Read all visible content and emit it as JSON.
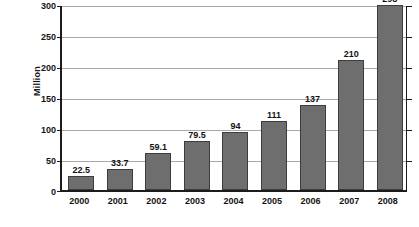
{
  "chart_data": {
    "type": "bar",
    "title": "",
    "xlabel": "",
    "ylabel": "Million",
    "categories": [
      "2000",
      "2001",
      "2002",
      "2003",
      "2004",
      "2005",
      "2006",
      "2007",
      "2008"
    ],
    "values": [
      22.5,
      33.7,
      59.1,
      79.5,
      94,
      111,
      137,
      210,
      298
    ],
    "value_labels": [
      "22.5",
      "33.7",
      "59.1",
      "79.5",
      "94",
      "111",
      "137",
      "210",
      "298"
    ],
    "ylim": [
      0,
      300
    ],
    "yticks": [
      0,
      50,
      100,
      150,
      200,
      250,
      300
    ],
    "ytick_labels": [
      "0",
      "50",
      "100",
      "150",
      "200",
      "250",
      "300"
    ],
    "grid": true,
    "legend": false,
    "legend_position": "none",
    "colors": {
      "bar_fill": "#6e6e6e",
      "bar_stroke": "#3d3d3d",
      "gridline": "#a8a8a8",
      "axis": "#1c1c1c",
      "text": "#121212",
      "background": "#ffffff"
    }
  }
}
